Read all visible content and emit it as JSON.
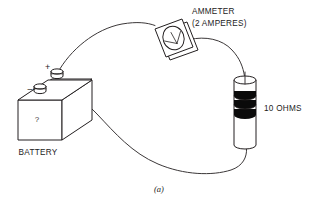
{
  "figure": {
    "caption": "(a)",
    "background_color": "#ffffff",
    "line_color": "#231f20",
    "band_color": "#0a0a0a"
  },
  "labels": {
    "ammeter_title": "AMMETER",
    "ammeter_rating": "(2 AMPERES)",
    "resistor": "10 OHMS",
    "battery": "BATTERY"
  },
  "battery": {
    "positive_terminal_symbol": "+",
    "negative_terminal_symbol": "–",
    "face_marking": "?",
    "terminal_count": 2
  },
  "resistor": {
    "value": "10 OHMS",
    "band_count": 3
  },
  "ammeter": {
    "reading_label": "(2 AMPERES)",
    "needle": true,
    "dial_shape": "circle"
  },
  "circuit": {
    "wire_count": 3,
    "components": [
      "BATTERY",
      "AMMETER",
      "10 OHMS"
    ]
  }
}
